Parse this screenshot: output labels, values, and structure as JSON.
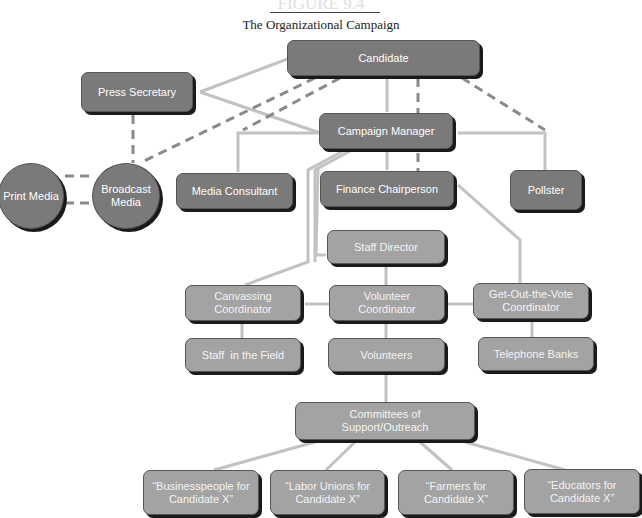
{
  "header": {
    "figure_label": "FIGURE 9.4",
    "title": "The Organizational Campaign"
  },
  "nodes": {
    "candidate": "Candidate",
    "press_secretary": "Press Secretary",
    "campaign_manager": "Campaign Manager",
    "print_media": "Print Media",
    "broadcast_media": "Broadcast Media",
    "media_consultant": "Media Consultant",
    "finance_chairperson": "Finance Chairperson",
    "pollster": "Pollster",
    "staff_director": "Staff Director",
    "canvassing_coordinator": "Canvassing Coordinator",
    "volunteer_coordinator": "Volunteer Coordinator",
    "gotv_coordinator": "Get-Out-the-Vote Coordinator",
    "staff_in_field": "Staff  in the Field",
    "volunteers": "Volunteers",
    "telephone_banks": "Telephone Banks",
    "committees": "Committees of Support/Outreach",
    "businesspeople": "“Businesspeople for Candidate X”",
    "labor_unions": "“Labor Unions for Candidate X”",
    "farmers": "“Farmers for Candidate X”",
    "educators": "“Educators for Candidate X”"
  },
  "colors": {
    "dark_node": "#7a7a7a",
    "light_node": "#a3a3a3",
    "line": "#bdbdbd",
    "dashed_line": "#8a8a8a"
  }
}
